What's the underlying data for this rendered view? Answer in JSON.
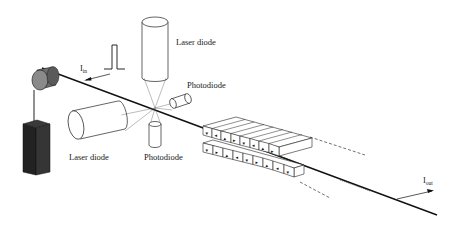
{
  "figure": {
    "labels": {
      "laser_diode_top": "Laser diode",
      "photodiode_right": "Photodiode",
      "laser_diode_left": "Laser diode",
      "photodiode_bottom": "Photodiode",
      "current_in_main": "I",
      "current_in_sub": "in",
      "current_out_main": "I",
      "current_out_sub": "out"
    },
    "components": [
      "spool",
      "weight",
      "wire",
      "laser-diode-top",
      "laser-diode-left",
      "photodiode-right",
      "photodiode-bottom",
      "input-pulse",
      "magnet-array-upper",
      "magnet-array-lower"
    ],
    "magnet_array": {
      "upper_row_arrows": [
        "down",
        "left",
        "up",
        "right",
        "down",
        "left",
        "up",
        "right"
      ],
      "lower_row_arrows": [
        "down",
        "right",
        "up",
        "left",
        "down",
        "right",
        "up",
        "left"
      ]
    },
    "colors": {
      "line": "#1a1a1a",
      "spool_fill": "#8a8a8a",
      "weight_fill": "#2b2b2b",
      "background": "#ffffff"
    }
  }
}
